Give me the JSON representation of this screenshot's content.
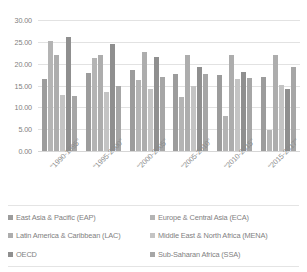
{
  "chart_data": {
    "type": "bar",
    "title": "",
    "xlabel": "",
    "ylabel": "",
    "ylim": [
      0,
      30
    ],
    "ytick_step": 5,
    "ytick_labels": [
      "30.00",
      "25.00",
      "20.00",
      "15.00",
      "10.00",
      "5.00",
      "0.00"
    ],
    "ytick_values": [
      30,
      25,
      20,
      15,
      10,
      5,
      0
    ],
    "grid": true,
    "legend_position": "bottom",
    "categories": [
      "\"1990-1995\"",
      "\"1995-2000\"",
      "\"2000-2005\"",
      "\"2005-2010\"",
      "\"2010-2015\"",
      "\"2015-2017\""
    ],
    "series": [
      {
        "name": "East Asia & Pacific (EAP)",
        "color": "#9c9c9c",
        "values": [
          16.5,
          17.9,
          18.5,
          17.7,
          17.4,
          16.9
        ]
      },
      {
        "name": "Europe & Central Asia (ECA)",
        "color": "#b4b4b4",
        "values": [
          25.2,
          21.3,
          16.2,
          12.4,
          8.1,
          4.9
        ]
      },
      {
        "name": "Latin America & Caribbean (LAC)",
        "color": "#adadad",
        "values": [
          21.9,
          22.0,
          22.6,
          22.1,
          21.9,
          21.9
        ]
      },
      {
        "name": "Middle East & North Africa (MENA)",
        "color": "#c4c4c4",
        "values": [
          12.8,
          13.6,
          14.3,
          14.8,
          16.6,
          15.1
        ]
      },
      {
        "name": "OECD",
        "color": "#8f8f8f",
        "values": [
          26.1,
          24.4,
          21.6,
          19.3,
          18.1,
          14.1
        ]
      },
      {
        "name": "Sub-Saharan Africa (SSA)",
        "color": "#a6a6a6",
        "values": [
          12.6,
          14.9,
          17.0,
          17.6,
          16.7,
          19.2
        ]
      }
    ]
  },
  "legend": {
    "items": [
      {
        "label": "East Asia & Pacific (EAP)",
        "color": "#9c9c9c"
      },
      {
        "label": "Europe & Central Asia (ECA)",
        "color": "#b4b4b4"
      },
      {
        "label": "Latin America & Caribbean (LAC)",
        "color": "#adadad"
      },
      {
        "label": "Middle East & North Africa (MENA)",
        "color": "#c4c4c4"
      },
      {
        "label": "OECD",
        "color": "#8f8f8f"
      },
      {
        "label": "Sub-Saharan Africa (SSA)",
        "color": "#a6a6a6"
      }
    ]
  }
}
